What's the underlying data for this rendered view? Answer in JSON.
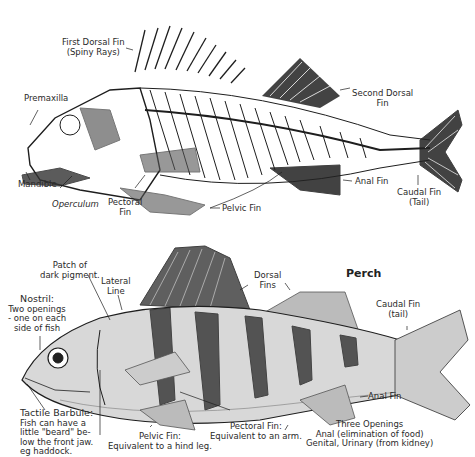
{
  "skeleton": {
    "labels": {
      "first_dorsal": [
        "First Dorsal Fin",
        "(Spiny Rays)"
      ],
      "premaxilla": "Premaxilla",
      "mandible": "Mandible",
      "operculum": "Operculum",
      "pectoral": [
        "Pectoral",
        "Fin"
      ],
      "pelvic": "Pelvic Fin",
      "second_dorsal": [
        "Second Dorsal",
        "Fin"
      ],
      "anal": "Anal Fin",
      "caudal": [
        "Caudal Fin",
        "(Tail)"
      ]
    }
  },
  "perch": {
    "title": "Perch",
    "labels": {
      "patch": [
        "Patch of",
        "dark pigment."
      ],
      "lateral": [
        "Lateral",
        "Line"
      ],
      "nostril": [
        "Nostril:",
        "Two openings",
        "- one on each",
        "side of fish"
      ],
      "dorsal": [
        "Dorsal",
        "Fins"
      ],
      "caudal": [
        "Caudal Fin",
        "(tail)"
      ],
      "anal": "Anal Fin",
      "barbule": [
        "Tactile Barbule:",
        "Fish can have a",
        "little \"beard\" be-",
        "low the front jaw.",
        "eg haddock."
      ],
      "pelvic": [
        "Pelvic Fin:",
        "Equivalent to a hind leg."
      ],
      "pectoral": [
        "Pectoral Fin:",
        "Equivalent to an arm."
      ],
      "openings": [
        "Three Openings",
        "Anal (elimination of food)",
        "Genital, Urinary (from kidney)"
      ]
    }
  },
  "colors": {
    "ink": "#1e1e1e",
    "background": "#ffffff"
  }
}
